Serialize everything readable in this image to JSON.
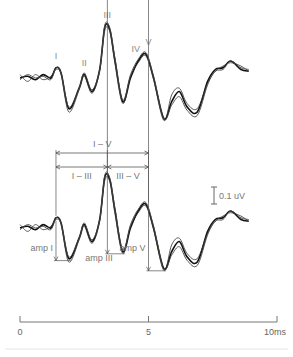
{
  "chart_data": {
    "type": "line",
    "title": "",
    "xlabel": "ms",
    "ylabel": "",
    "xlim": [
      0,
      10
    ],
    "x_ticks": [
      {
        "value": 0,
        "label": "0"
      },
      {
        "value": 5,
        "label": "5"
      },
      {
        "value": 10,
        "label": "10ms"
      }
    ],
    "scale_bar": {
      "value_uV": 0.1,
      "label": "0.1 uV"
    },
    "peak_labels": [
      "I",
      "II",
      "III",
      "IV",
      "V"
    ],
    "panels": [
      {
        "name": "upper-traces",
        "description": "Superimposed ABR recordings with labelled waves I-V",
        "series": [
          {
            "name": "trace-1",
            "x": [
              0.0,
              0.3,
              0.6,
              0.9,
              1.2,
              1.4,
              1.6,
              1.9,
              2.3,
              2.5,
              2.8,
              3.1,
              3.3,
              3.5,
              3.7,
              4.0,
              4.3,
              4.6,
              4.9,
              5.2,
              5.6,
              5.9,
              6.2,
              6.5,
              6.9,
              7.3,
              7.6,
              7.9,
              8.2,
              8.6,
              8.9
            ],
            "y": [
              0.0,
              0.01,
              -0.01,
              0.02,
              0.0,
              0.06,
              0.03,
              -0.18,
              -0.06,
              0.02,
              -0.08,
              0.05,
              0.3,
              0.28,
              0.1,
              -0.14,
              0.0,
              0.1,
              0.14,
              0.0,
              -0.24,
              -0.14,
              -0.08,
              -0.17,
              -0.2,
              -0.02,
              0.05,
              0.06,
              0.1,
              0.05,
              0.04
            ]
          },
          {
            "name": "trace-2",
            "x": [
              0.0,
              0.3,
              0.6,
              0.9,
              1.2,
              1.4,
              1.6,
              1.9,
              2.3,
              2.5,
              2.8,
              3.1,
              3.3,
              3.5,
              3.7,
              4.0,
              4.3,
              4.6,
              4.9,
              5.2,
              5.6,
              5.9,
              6.2,
              6.5,
              6.9,
              7.3,
              7.6,
              7.9,
              8.2,
              8.6,
              8.9
            ],
            "y": [
              0.02,
              -0.02,
              0.02,
              -0.01,
              0.01,
              0.05,
              0.02,
              -0.2,
              -0.07,
              0.01,
              -0.09,
              0.04,
              0.28,
              0.27,
              0.08,
              -0.15,
              0.01,
              0.09,
              0.13,
              -0.01,
              -0.25,
              -0.1,
              -0.06,
              -0.15,
              -0.18,
              -0.03,
              0.04,
              0.07,
              0.09,
              0.07,
              0.04
            ]
          },
          {
            "name": "trace-3",
            "x": [
              0.0,
              0.3,
              0.6,
              0.9,
              1.2,
              1.4,
              1.6,
              1.9,
              2.3,
              2.5,
              2.8,
              3.1,
              3.3,
              3.5,
              3.7,
              4.0,
              4.3,
              4.6,
              4.9,
              5.2,
              5.6,
              5.9,
              6.2,
              6.5,
              6.9,
              7.3,
              7.6,
              7.9,
              8.2,
              8.6,
              8.9
            ],
            "y": [
              -0.01,
              0.02,
              0.0,
              0.01,
              -0.01,
              0.06,
              0.03,
              -0.17,
              -0.06,
              0.03,
              -0.07,
              0.05,
              0.31,
              0.29,
              0.11,
              -0.13,
              0.02,
              0.11,
              0.15,
              0.01,
              -0.24,
              -0.16,
              -0.11,
              -0.19,
              -0.22,
              -0.04,
              0.04,
              0.05,
              0.1,
              0.06,
              0.05
            ]
          }
        ],
        "peaks": [
          {
            "label": "I",
            "x": 1.4,
            "y": 0.06
          },
          {
            "label": "II",
            "x": 2.5,
            "y": 0.02
          },
          {
            "label": "III",
            "x": 3.4,
            "y": 0.3
          },
          {
            "label": "IV",
            "x": 4.5,
            "y": 0.1
          },
          {
            "label": "V",
            "x": 5.0,
            "y": 0.14
          }
        ]
      },
      {
        "name": "lower-traces",
        "description": "Same recordings annotated with interpeak latencies and amplitudes",
        "series": [
          {
            "name": "trace-1",
            "x": [
              0.0,
              0.3,
              0.6,
              0.9,
              1.2,
              1.4,
              1.6,
              1.9,
              2.3,
              2.5,
              2.8,
              3.1,
              3.3,
              3.5,
              3.7,
              4.0,
              4.3,
              4.6,
              4.9,
              5.2,
              5.6,
              5.9,
              6.2,
              6.5,
              6.9,
              7.3,
              7.6,
              7.9,
              8.2,
              8.6,
              8.9
            ],
            "y": [
              0.0,
              0.01,
              -0.01,
              0.02,
              0.0,
              0.06,
              0.03,
              -0.18,
              -0.06,
              0.02,
              -0.08,
              0.05,
              0.3,
              0.28,
              0.1,
              -0.14,
              0.0,
              0.1,
              0.14,
              0.0,
              -0.24,
              -0.14,
              -0.08,
              -0.17,
              -0.2,
              -0.02,
              0.05,
              0.06,
              0.1,
              0.05,
              0.04
            ]
          },
          {
            "name": "trace-2",
            "x": [
              0.0,
              0.3,
              0.6,
              0.9,
              1.2,
              1.4,
              1.6,
              1.9,
              2.3,
              2.5,
              2.8,
              3.1,
              3.3,
              3.5,
              3.7,
              4.0,
              4.3,
              4.6,
              4.9,
              5.2,
              5.6,
              5.9,
              6.2,
              6.5,
              6.9,
              7.3,
              7.6,
              7.9,
              8.2,
              8.6,
              8.9
            ],
            "y": [
              0.02,
              -0.02,
              0.02,
              -0.01,
              0.01,
              0.05,
              0.02,
              -0.2,
              -0.07,
              0.01,
              -0.09,
              0.04,
              0.28,
              0.27,
              0.08,
              -0.15,
              0.01,
              0.09,
              0.13,
              -0.01,
              -0.25,
              -0.1,
              -0.06,
              -0.15,
              -0.18,
              -0.03,
              0.04,
              0.07,
              0.09,
              0.07,
              0.04
            ]
          },
          {
            "name": "trace-3",
            "x": [
              0.0,
              0.3,
              0.6,
              0.9,
              1.2,
              1.4,
              1.6,
              1.9,
              2.3,
              2.5,
              2.8,
              3.1,
              3.3,
              3.5,
              3.7,
              4.0,
              4.3,
              4.6,
              4.9,
              5.2,
              5.6,
              5.9,
              6.2,
              6.5,
              6.9,
              7.3,
              7.6,
              7.9,
              8.2,
              8.6,
              8.9
            ],
            "y": [
              -0.01,
              0.02,
              0.0,
              0.01,
              -0.01,
              0.06,
              0.03,
              -0.17,
              -0.06,
              0.03,
              -0.07,
              0.05,
              0.31,
              0.29,
              0.11,
              -0.13,
              0.02,
              0.11,
              0.15,
              0.01,
              -0.24,
              -0.16,
              -0.11,
              -0.19,
              -0.22,
              -0.04,
              0.04,
              0.05,
              0.1,
              0.06,
              0.05
            ]
          }
        ],
        "interpeak_intervals": [
          {
            "label": "I – V",
            "from_peak": "I",
            "to_peak": "V"
          },
          {
            "label": "I – III",
            "from_peak": "I",
            "to_peak": "III"
          },
          {
            "label": "III – V",
            "from_peak": "III",
            "to_peak": "V"
          }
        ],
        "amplitudes": [
          {
            "label": "amp I",
            "peak": "I",
            "peak_x": 1.4,
            "trough_x": 1.9
          },
          {
            "label": "amp III",
            "peak": "III",
            "peak_x": 3.4,
            "trough_x": 4.0
          },
          {
            "label": "amp V",
            "peak": "V",
            "peak_x": 5.0,
            "trough_x": 5.6
          }
        ]
      }
    ],
    "grid": false,
    "legend": "none"
  }
}
